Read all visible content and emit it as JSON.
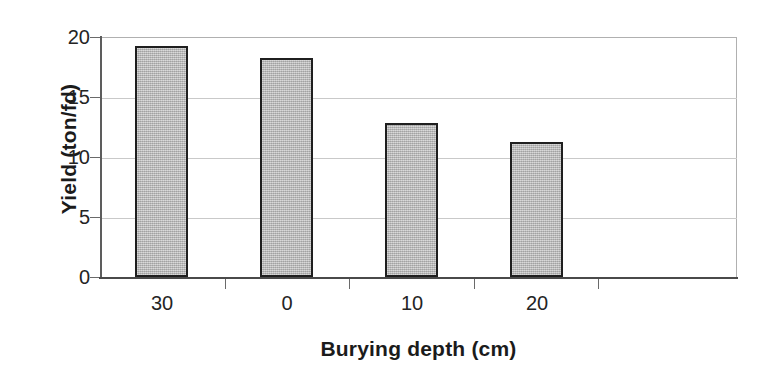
{
  "chart_data": {
    "type": "bar",
    "title": "",
    "subtitle": "",
    "xlabel": "Burying depth (cm)",
    "ylabel": "Yield (ton/fd)",
    "categories": [
      "30",
      "0",
      "10",
      "20"
    ],
    "values": [
      19.3,
      18.3,
      12.9,
      11.3
    ],
    "series": [
      {
        "name": "Yield",
        "values": [
          19.3,
          18.3,
          12.9,
          11.3
        ]
      }
    ],
    "ylim": [
      0,
      20
    ],
    "y_ticks": [
      0,
      5,
      10,
      15,
      20
    ],
    "y_tick_labels": [
      "0",
      "5",
      "10",
      "15",
      "20"
    ],
    "grid": true,
    "grid_axis": "y",
    "legend": false,
    "legend_position": "none",
    "bar_fill_color": "#b9b9b9",
    "bar_edge_color": "#1f1f1f",
    "gridline_color": "#c9c9c9",
    "axis_color": "#4a4a4a",
    "background_color": "#ffffff"
  }
}
